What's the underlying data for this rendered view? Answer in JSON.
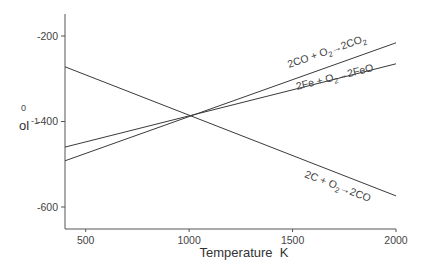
{
  "chart_data": {
    "type": "line",
    "title": "",
    "xlabel": "Temperature  K",
    "ylabel_visible": {
      "sup": "0",
      "main": "ol",
      "main_sup": "-1"
    },
    "xlim": [
      400,
      2000
    ],
    "ylim": [
      -650,
      -150
    ],
    "xticks": [
      500,
      1000,
      1500,
      2000
    ],
    "xtick_labels": [
      "500",
      "1000",
      "1500",
      "2000"
    ],
    "yticks": [
      -200,
      -400,
      -600
    ],
    "ytick_labels": [
      "-200",
      "-400",
      "-600"
    ],
    "grid": false,
    "legend": "none (inline labels)",
    "series": [
      {
        "name": "2C + O2→2CO",
        "label_parts": [
          "2C + O",
          "2",
          "→2CO"
        ],
        "x": [
          400,
          2000
        ],
        "values": [
          -272,
          -574
        ]
      },
      {
        "name": "2CO + O2→2CO2",
        "label_parts": [
          "2CO  + O",
          "2",
          "→2CO",
          "2"
        ],
        "x": [
          400,
          2000
        ],
        "values": [
          -492,
          -216
        ]
      },
      {
        "name": "2Fe + O2→2FeO",
        "label_parts": [
          "2Fe + O",
          "2",
          "→2FeO"
        ],
        "x": [
          400,
          2000
        ],
        "values": [
          -460,
          -265
        ]
      }
    ],
    "annotations": [
      "lines intersect near 1000 K, ≈ -387"
    ]
  },
  "colors": {
    "line": "#3a3a3a",
    "axis": "#555555",
    "text": "#444444",
    "background": "#ffffff"
  }
}
